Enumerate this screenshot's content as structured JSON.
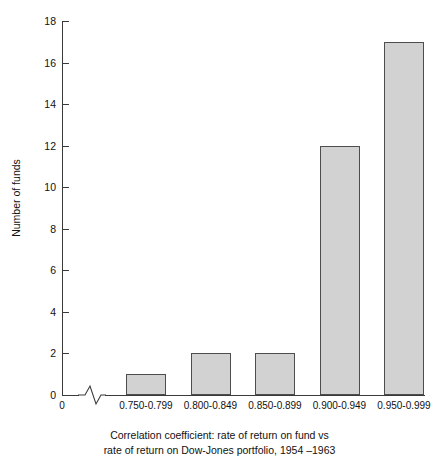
{
  "chart_data": {
    "type": "bar",
    "title": "",
    "subtitle": "",
    "xlabel": "Correlation coefficient: rate of return on fund vs rate of return on Dow-Jones portfolio, 1954 –1963",
    "ylabel": "Number of funds",
    "categories": [
      "0.750-0.799",
      "0.800-0.849",
      "0.850-0.899",
      "0.900-0.949",
      "0.950-0.999"
    ],
    "values": [
      1,
      2,
      2,
      12,
      17
    ],
    "ylim": [
      0,
      18
    ],
    "ytick_values": [
      0,
      2,
      4,
      6,
      8,
      10,
      12,
      14,
      16,
      18
    ],
    "ytick_labels": [
      "0",
      "2",
      "4",
      "6",
      "8",
      "10",
      "12",
      "14",
      "16",
      "18"
    ],
    "grid": false,
    "legend": null,
    "axis_break": true,
    "origin_label": "0",
    "bar_fill_color": "#d2d2d2",
    "bar_border_color": "#4d4d4d",
    "axis_color": "#3a3a3a",
    "text_color": "#111111"
  },
  "caption": {
    "line1": "Correlation coefficient: rate of return on fund vs",
    "line2": "rate of return on Dow-Jones portfolio, 1954 –1963"
  }
}
